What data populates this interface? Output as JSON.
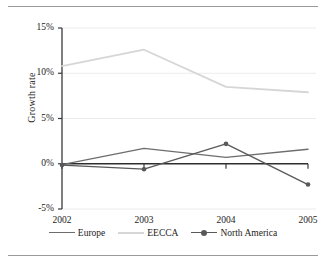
{
  "figure": {
    "background": "#ffffff",
    "rule_color": "#9a9a9a"
  },
  "chart_data": {
    "type": "line",
    "title": "",
    "xlabel": "",
    "ylabel": "Growth rate",
    "categories": [
      "2002",
      "2003",
      "2004",
      "2005"
    ],
    "x_tick_labels": [
      "2002",
      "2003",
      "2004",
      "2005"
    ],
    "y_tick_labels": [
      "15%",
      "10%",
      "5%",
      "0%",
      "-5%"
    ],
    "y_tick_values": [
      15,
      10,
      5,
      0,
      -5
    ],
    "ylim": [
      -5,
      15
    ],
    "grid": true,
    "grid_axis": "y",
    "legend_position": "bottom",
    "series": [
      {
        "name": "Europe",
        "color": "#6d6d6d",
        "marker": "none",
        "values": [
          -0.1,
          1.7,
          0.7,
          1.6
        ]
      },
      {
        "name": "EECCA",
        "color": "#d6d6d6",
        "marker": "none",
        "values": [
          10.8,
          12.6,
          8.5,
          7.9
        ]
      },
      {
        "name": "North America",
        "color": "#595959",
        "marker": "circle",
        "values": [
          -0.15,
          -0.6,
          2.2,
          -2.3
        ]
      }
    ],
    "legend": [
      {
        "label": "Europe",
        "color": "#6d6d6d",
        "marker": "none"
      },
      {
        "label": "EECCA",
        "color": "#d6d6d6",
        "marker": "none"
      },
      {
        "label": "North America",
        "color": "#595959",
        "marker": "circle"
      }
    ]
  }
}
